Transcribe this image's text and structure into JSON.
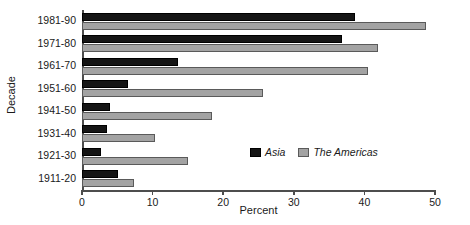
{
  "chart_data": {
    "type": "bar",
    "orientation": "horizontal",
    "title": "",
    "xlabel": "Percent",
    "ylabel": "Decade",
    "categories": [
      "1981-90",
      "1971-80",
      "1961-70",
      "1951-60",
      "1941-50",
      "1931-40",
      "1921-30",
      "1911-20"
    ],
    "series": [
      {
        "name": "Asia",
        "color": "#151515",
        "values": [
          38.7,
          36.8,
          13.6,
          6.5,
          3.9,
          3.5,
          2.7,
          5.1
        ]
      },
      {
        "name": "The Americas",
        "color": "#a3a3a3",
        "values": [
          48.7,
          41.9,
          40.5,
          25.6,
          18.4,
          10.3,
          15.0,
          7.4
        ]
      }
    ],
    "xlim": [
      0,
      50
    ],
    "xticks": [
      0,
      10,
      20,
      30,
      40,
      50
    ],
    "xtick_labels": [
      "0",
      "10",
      "20",
      "30",
      "40",
      "50"
    ],
    "grid": false,
    "legend_position": "bottom-right"
  },
  "axes": {
    "x_title": "Percent",
    "y_title": "Decade"
  },
  "legend": {
    "entries": [
      {
        "label": "Asia"
      },
      {
        "label": "The Americas"
      }
    ]
  }
}
